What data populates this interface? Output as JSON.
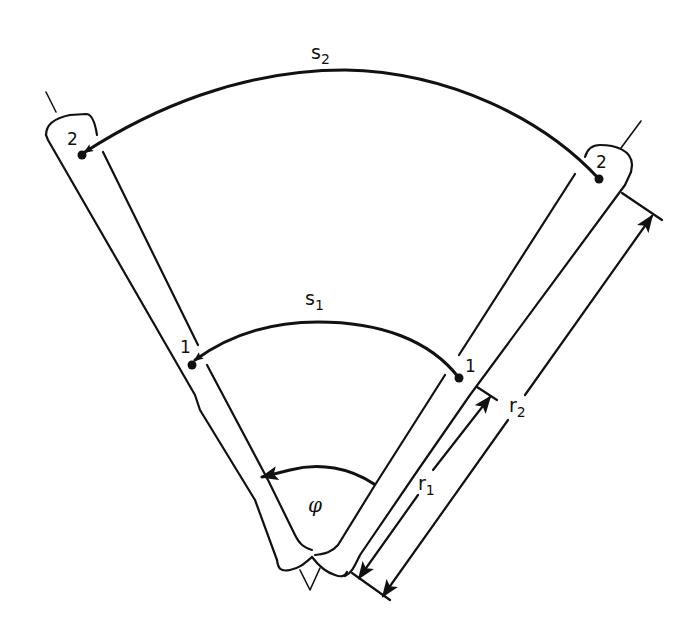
{
  "figure": {
    "colors": {
      "ink": "#111111",
      "background": "#ffffff"
    }
  },
  "labels": {
    "s2": {
      "base": "s",
      "sub": "2"
    },
    "s1": {
      "base": "s",
      "sub": "1"
    },
    "r1": {
      "base": "r",
      "sub": "1"
    },
    "r2": {
      "base": "r",
      "sub": "2"
    },
    "phi": "φ",
    "point_left_2": "2",
    "point_right_2": "2",
    "point_left_1": "1",
    "point_right_1": "1"
  },
  "elements": {
    "arcs": [
      {
        "name": "arc-s2",
        "label": "s2",
        "from": "right point 2",
        "to": "left point 2",
        "arrow": "left"
      },
      {
        "name": "arc-s1",
        "label": "s1",
        "from": "right point 1",
        "to": "left point 1",
        "arrow": "left"
      },
      {
        "name": "arc-phi",
        "label": "φ",
        "from": "right bone",
        "to": "left bone",
        "arrow": "left"
      }
    ],
    "dimensions": [
      {
        "name": "dimension-r1",
        "label": "r1",
        "from": "joint",
        "to": "point 1"
      },
      {
        "name": "dimension-r2",
        "label": "r2",
        "from": "joint",
        "to": "point 2"
      }
    ]
  }
}
